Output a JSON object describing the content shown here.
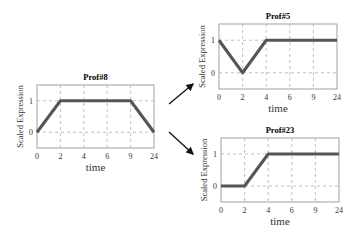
{
  "chart_data": [
    {
      "type": "line",
      "title": "Prof#8",
      "xlabel": "time",
      "ylabel": "Scaled Expression",
      "categories": [
        "0",
        "2",
        "4",
        "6",
        "9",
        "24"
      ],
      "values": [
        0,
        1,
        1,
        1,
        1,
        0
      ],
      "yticks": [
        "0",
        "1"
      ],
      "ylim": [
        -0.5,
        1.5
      ],
      "grid": true
    },
    {
      "type": "line",
      "title": "Prof#5",
      "xlabel": "time",
      "ylabel": "Scaled Expression",
      "categories": [
        "0",
        "2",
        "4",
        "6",
        "9",
        "24"
      ],
      "values": [
        1,
        0,
        1,
        1,
        1,
        1
      ],
      "yticks": [
        "0",
        "1"
      ],
      "ylim": [
        -0.5,
        1.5
      ],
      "grid": true
    },
    {
      "type": "line",
      "title": "Prof#23",
      "xlabel": "time",
      "ylabel": "Scaled Expression",
      "categories": [
        "0",
        "2",
        "4",
        "6",
        "9",
        "24"
      ],
      "values": [
        0,
        0,
        1,
        1,
        1,
        1
      ],
      "yticks": [
        "0",
        "1"
      ],
      "ylim": [
        -0.5,
        1.5
      ],
      "grid": true
    }
  ],
  "arrows": [
    {
      "from": "Prof#8",
      "to": "Prof#5",
      "direction": "up-right"
    },
    {
      "from": "Prof#8",
      "to": "Prof#23",
      "direction": "down-right"
    }
  ],
  "style": {
    "line_color": "#555555",
    "grid_color": "#999999",
    "axis_color": "#888888"
  }
}
